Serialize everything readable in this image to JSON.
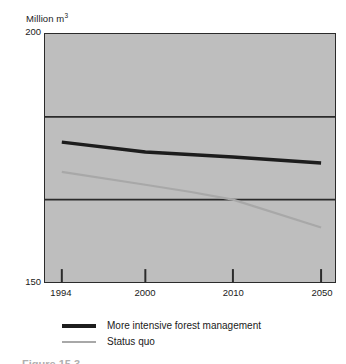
{
  "chart_data": {
    "type": "line",
    "title": "",
    "subtitle": "",
    "xlabel": "",
    "ylabel": "Million m<sup>3</sup>",
    "ylabel_text": "Million m3",
    "unit_label_main": "Million m",
    "unit_label_exponent": "3",
    "categories": [
      "1994",
      "2000",
      "2010",
      "2050"
    ],
    "x": [
      1994,
      2000,
      2010,
      2050
    ],
    "x_spacing": "categorical-uneven",
    "xtick_labels": [
      "1994",
      "2000",
      "2010",
      "2050"
    ],
    "ylim": [
      150,
      200
    ],
    "ytick_labels": [
      "200",
      "150"
    ],
    "ytick_top": "200",
    "ytick_bottom": "150",
    "gridlines": [
      183.3,
      166.6
    ],
    "grid": true,
    "legend_position": "below-plot",
    "series": [
      {
        "name": "More intensive forest management",
        "color": "#1d1d1d",
        "width": 3.4,
        "values": [
          178.2,
          176.2,
          175.2,
          174.0
        ]
      },
      {
        "name": "Status quo",
        "color": "#a8a8a8",
        "width": 2.2,
        "values": [
          172.2,
          169.6,
          166.6,
          161.0
        ]
      }
    ],
    "plot_background": "#bebebe",
    "frame_color": "#2b2b2b",
    "annotations": []
  },
  "legend": {
    "items": [
      {
        "label": "More intensive forest management",
        "swatch": "thick-black-line"
      },
      {
        "label": "Status quo",
        "swatch": "thin-grey-line"
      }
    ]
  },
  "caption_remnant": "Figure 15.3"
}
